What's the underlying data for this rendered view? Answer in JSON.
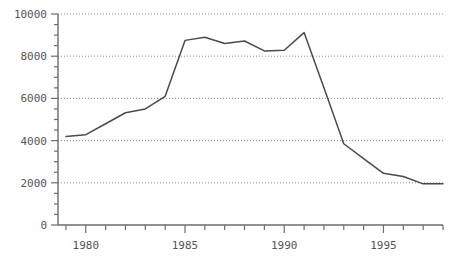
{
  "chart_data": {
    "type": "line",
    "title": "",
    "subtitle": "",
    "xlabel": "",
    "ylabel": "",
    "xlim": [
      1978.6,
      1998.0
    ],
    "ylim": [
      0,
      10000
    ],
    "grid": true,
    "grid_axis": "y",
    "legend": "none",
    "x_major_ticks": [
      1980,
      1985,
      1990,
      1995
    ],
    "x_tick_labels": [
      "1980",
      "1985",
      "1990",
      "1995"
    ],
    "x_minor_tick_interval": 1,
    "y_major_ticks": [
      0,
      2000,
      4000,
      6000,
      8000,
      10000
    ],
    "y_tick_labels": [
      "0",
      "2000",
      "4000",
      "6000",
      "8000",
      "10000"
    ],
    "y_minor_tick_interval": 500,
    "line_color": "#4a4a52",
    "grid_color": "#8f8f9a",
    "axis_color": "#6b6b72",
    "background_color": "#ffffff",
    "x": [
      1979,
      1980,
      1981,
      1982,
      1983,
      1984,
      1985,
      1986,
      1987,
      1988,
      1989,
      1990,
      1991,
      1992,
      1993,
      1994,
      1995,
      1996,
      1997,
      1998
    ],
    "values": [
      4200,
      4280,
      4800,
      5320,
      5500,
      6100,
      8750,
      8900,
      8600,
      8720,
      8250,
      8280,
      9120,
      6500,
      3850,
      3150,
      2450,
      2300,
      1950,
      1950
    ],
    "series": [
      {
        "name": "series-1",
        "color": "#4a4a52",
        "values": [
          4200,
          4280,
          4800,
          5320,
          5500,
          6100,
          8750,
          8900,
          8600,
          8720,
          8250,
          8280,
          9120,
          6500,
          3850,
          3150,
          2450,
          2300,
          1950,
          1950
        ]
      }
    ]
  },
  "axes": {
    "y_ticks": [
      {
        "label": "10000",
        "value": 10000
      },
      {
        "label": "8000",
        "value": 8000
      },
      {
        "label": "6000",
        "value": 6000
      },
      {
        "label": "4000",
        "value": 4000
      },
      {
        "label": "2000",
        "value": 2000
      },
      {
        "label": "0",
        "value": 0
      }
    ],
    "x_ticks": [
      {
        "label": "1980",
        "value": 1980
      },
      {
        "label": "1985",
        "value": 1985
      },
      {
        "label": "1990",
        "value": 1990
      },
      {
        "label": "1995",
        "value": 1995
      }
    ]
  }
}
